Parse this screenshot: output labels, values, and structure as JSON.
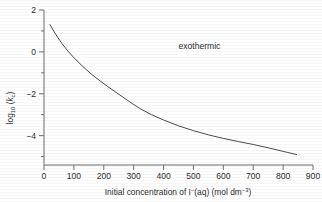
{
  "chart_data": {
    "type": "line",
    "title": "",
    "xlabel": "Initial concentration of I⁻(aq) (mol dm⁻³)",
    "xlabel_parts": {
      "lead": "Initial concentration of I",
      "ion_charge": "−",
      "mid": "(aq) (mol dm",
      "exponent": "−3",
      "tail": ")"
    },
    "ylabel": "log10 (kc)",
    "ylabel_parts": {
      "lead": "log",
      "base": "10",
      "open": " (",
      "symbol": "k",
      "symbol_sub": "c",
      "close": ")"
    },
    "xlim": [
      0,
      900
    ],
    "ylim": [
      -5.2,
      2.2
    ],
    "xticks": [
      0,
      100,
      200,
      300,
      400,
      500,
      600,
      700,
      800,
      900
    ],
    "xtick_labels": [
      "0",
      "100",
      "200",
      "300",
      "400",
      "500",
      "600",
      "700",
      "800",
      "900"
    ],
    "yticks_major": [
      2,
      0,
      -2,
      -4
    ],
    "ytick_labels": [
      "2",
      "0",
      "−2",
      "−4"
    ],
    "yticks_minor": [
      1,
      -1,
      -3,
      -5
    ],
    "grid": false,
    "legend": false,
    "annotations": [
      {
        "text": "exothermic",
        "x": 520,
        "y": 0.35
      }
    ],
    "series": [
      {
        "name": "log10 Kc vs [I-]",
        "color": "#4a4a4a",
        "x": [
          20,
          40,
          60,
          80,
          100,
          130,
          160,
          200,
          240,
          280,
          320,
          360,
          400,
          450,
          500,
          550,
          600,
          650,
          700,
          750,
          800,
          845
        ],
        "values": [
          1.5,
          1.02,
          0.6,
          0.24,
          -0.08,
          -0.5,
          -0.88,
          -1.32,
          -1.72,
          -2.12,
          -2.5,
          -2.8,
          -3.05,
          -3.33,
          -3.56,
          -3.76,
          -3.93,
          -4.08,
          -4.22,
          -4.38,
          -4.55,
          -4.7
        ]
      }
    ]
  },
  "colors": {
    "axis": "#6e6e6e",
    "curve": "#4a4a4a",
    "text": "#2b2b2b",
    "background": "#ffffff"
  }
}
